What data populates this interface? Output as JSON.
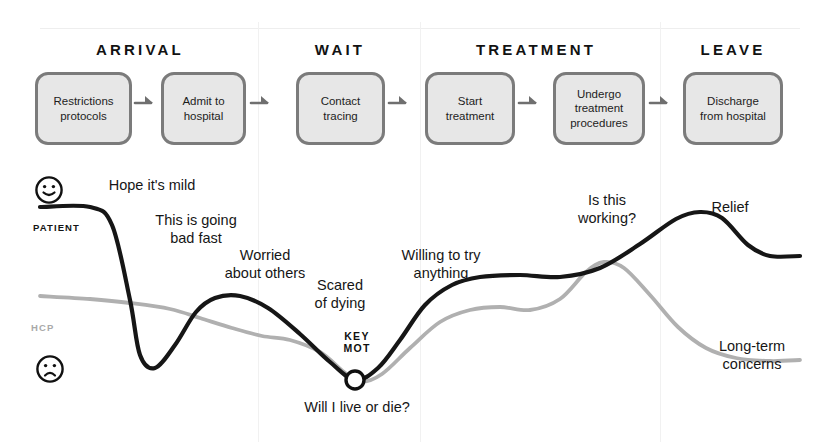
{
  "diagram": {
    "title_visible": false,
    "colors": {
      "patient_curve": "#161616",
      "hcp_curve": "#b0b0b0",
      "box_fill": "#e7e7e7",
      "box_border": "#7b7b7b",
      "divider": "#f1f1f1",
      "text": "#1a1a1a"
    },
    "stages": [
      {
        "label": "ARRIVAL",
        "center_x": 140
      },
      {
        "label": "WAIT",
        "center_x": 340
      },
      {
        "label": "TREATMENT",
        "center_x": 536
      },
      {
        "label": "LEAVE",
        "center_x": 733
      }
    ],
    "steps": [
      {
        "lines": [
          "Restrictions",
          "protocols"
        ],
        "x": 35,
        "y": 72,
        "w": 97,
        "h": 73
      },
      {
        "lines": [
          "Admit to",
          "hospital"
        ],
        "x": 161,
        "y": 72,
        "w": 85,
        "h": 73
      },
      {
        "lines": [
          "Contact",
          "tracing"
        ],
        "x": 296,
        "y": 72,
        "w": 89,
        "h": 73
      },
      {
        "lines": [
          "Start",
          "treatment"
        ],
        "x": 425,
        "y": 72,
        "w": 90,
        "h": 73
      },
      {
        "lines": [
          "Undergo",
          "treatment",
          "procedures"
        ],
        "x": 553,
        "y": 72,
        "w": 92,
        "h": 73
      },
      {
        "lines": [
          "Discharge",
          "from hospital"
        ],
        "x": 683,
        "y": 72,
        "w": 100,
        "h": 73
      }
    ],
    "arrows": [
      {
        "x": 133,
        "y": 100
      },
      {
        "x": 249,
        "y": 100
      },
      {
        "x": 387,
        "y": 100
      },
      {
        "x": 517,
        "y": 100
      },
      {
        "x": 648,
        "y": 100
      }
    ],
    "dividers_x": [
      258,
      420,
      660
    ],
    "faces": [
      {
        "name": "happy-face",
        "mood": "happy",
        "x": 34,
        "y": 175
      },
      {
        "name": "sad-face",
        "mood": "sad",
        "x": 35,
        "y": 354
      }
    ],
    "lanes": [
      {
        "key": "patient",
        "label": "PATIENT",
        "x": 33,
        "y": 222
      },
      {
        "key": "hcp",
        "label": "HCP",
        "x": 31,
        "y": 322
      }
    ],
    "annotations": [
      {
        "lines": [
          "Hope it's mild"
        ],
        "center_x": 152,
        "y": 177,
        "series": "patient"
      },
      {
        "lines": [
          "This is going",
          "bad fast"
        ],
        "center_x": 196,
        "y": 212,
        "series": "patient"
      },
      {
        "lines": [
          "Worried",
          "about others"
        ],
        "center_x": 265,
        "y": 247,
        "series": "patient"
      },
      {
        "lines": [
          "Scared",
          "of dying"
        ],
        "center_x": 340,
        "y": 277,
        "series": "patient"
      },
      {
        "lines": [
          "Willing to try",
          "anything"
        ],
        "center_x": 441,
        "y": 247,
        "series": "patient"
      },
      {
        "lines": [
          "Is this",
          "working?"
        ],
        "center_x": 607,
        "y": 192,
        "series": "hcp"
      },
      {
        "lines": [
          "Relief"
        ],
        "center_x": 730,
        "y": 199,
        "series": "patient"
      },
      {
        "lines": [
          "Long-term",
          "concerns"
        ],
        "center_x": 752,
        "y": 338,
        "series": "hcp"
      },
      {
        "lines": [
          "Will I live or die?"
        ],
        "center_x": 357,
        "y": 399,
        "series": "patient"
      }
    ],
    "key_moment": {
      "label_lines": [
        "KEY",
        "MOT"
      ],
      "label_center_x": 357,
      "label_y": 330,
      "marker_x": 355,
      "marker_y": 380,
      "marker_r": 9
    }
  },
  "chart_data": {
    "type": "line",
    "title": "",
    "xlabel": "",
    "ylabel": "",
    "grid": false,
    "legend": [
      "PATIENT",
      "HCP"
    ],
    "x_axis_categories": [
      "ARRIVAL",
      "WAIT",
      "TREATMENT",
      "LEAVE"
    ],
    "y_axis_labels": {
      "top": "happy-face",
      "bottom": "sad-face"
    },
    "series": [
      {
        "name": "PATIENT",
        "color": "#161616",
        "points": [
          [
            40,
            207
          ],
          [
            90,
            207
          ],
          [
            112,
            225
          ],
          [
            130,
            300
          ],
          [
            140,
            355
          ],
          [
            155,
            368
          ],
          [
            175,
            345
          ],
          [
            196,
            312
          ],
          [
            215,
            298
          ],
          [
            240,
            296
          ],
          [
            268,
            308
          ],
          [
            300,
            334
          ],
          [
            330,
            362
          ],
          [
            355,
            380
          ],
          [
            378,
            368
          ],
          [
            400,
            340
          ],
          [
            425,
            305
          ],
          [
            452,
            285
          ],
          [
            480,
            277
          ],
          [
            520,
            275
          ],
          [
            560,
            277
          ],
          [
            600,
            268
          ],
          [
            640,
            244
          ],
          [
            676,
            219
          ],
          [
            700,
            212
          ],
          [
            722,
            218
          ],
          [
            748,
            245
          ],
          [
            770,
            256
          ],
          [
            800,
            256
          ]
        ]
      },
      {
        "name": "HCP",
        "color": "#b0b0b0",
        "points": [
          [
            40,
            296
          ],
          [
            90,
            299
          ],
          [
            130,
            303
          ],
          [
            170,
            309
          ],
          [
            200,
            318
          ],
          [
            232,
            328
          ],
          [
            262,
            336
          ],
          [
            290,
            340
          ],
          [
            320,
            352
          ],
          [
            344,
            372
          ],
          [
            360,
            382
          ],
          [
            382,
            374
          ],
          [
            410,
            348
          ],
          [
            440,
            322
          ],
          [
            470,
            310
          ],
          [
            500,
            307
          ],
          [
            530,
            310
          ],
          [
            560,
            299
          ],
          [
            586,
            272
          ],
          [
            604,
            262
          ],
          [
            624,
            268
          ],
          [
            650,
            295
          ],
          [
            678,
            327
          ],
          [
            706,
            348
          ],
          [
            736,
            358
          ],
          [
            770,
            361
          ],
          [
            800,
            360
          ]
        ]
      }
    ]
  }
}
